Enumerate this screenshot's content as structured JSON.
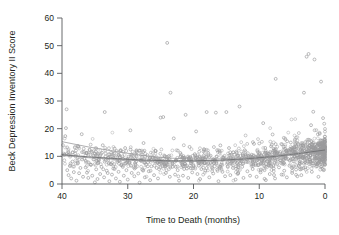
{
  "chart_data": {
    "type": "scatter",
    "title": "",
    "xlabel": "Time to Death (months)",
    "ylabel": "Beck Depression Inventory II Score",
    "xlim": [
      40,
      0
    ],
    "ylim": [
      0,
      60
    ],
    "x_reversed": true,
    "grid": false,
    "legend": false,
    "xticks": [
      40,
      30,
      20,
      10,
      0
    ],
    "yticks": [
      0,
      10,
      20,
      30,
      40,
      50,
      60
    ],
    "xtick_labels": [
      "40",
      "30",
      "20",
      "10",
      "0"
    ],
    "ytick_labels": [
      "0",
      "10",
      "20",
      "30",
      "40",
      "50",
      "60"
    ],
    "marker": "open-circle",
    "marker_color": "#9a9a9c",
    "fit_line_color": "#6d6e71",
    "band_line_color": "#9b9b9d",
    "fit_curve": {
      "description": "regression fit with upper and lower confidence bands",
      "x": [
        40,
        36,
        32,
        28,
        24,
        20,
        16,
        12,
        8,
        4,
        0
      ],
      "center": [
        10.6,
        9.8,
        9.2,
        8.7,
        8.4,
        8.4,
        8.6,
        9.1,
        9.9,
        11.0,
        12.3
      ],
      "upper": [
        15.3,
        13.4,
        11.8,
        10.4,
        9.4,
        9.0,
        9.1,
        9.5,
        10.3,
        11.4,
        12.8
      ],
      "lower": [
        10.3,
        9.5,
        8.9,
        8.4,
        8.1,
        8.1,
        8.3,
        8.8,
        9.6,
        10.7,
        11.9
      ]
    },
    "notable_outliers": [
      {
        "x": 24,
        "y": 51
      },
      {
        "x": 2.5,
        "y": 47
      },
      {
        "x": 2.8,
        "y": 46
      },
      {
        "x": 1.6,
        "y": 45
      },
      {
        "x": 7.5,
        "y": 38
      },
      {
        "x": 0.6,
        "y": 37
      },
      {
        "x": 23.5,
        "y": 33
      },
      {
        "x": 3.2,
        "y": 33
      },
      {
        "x": 39.5,
        "y": 27
      },
      {
        "x": 33.5,
        "y": 26
      }
    ],
    "points": [
      [
        39.6,
        10.6
      ],
      [
        39.4,
        20.2
      ],
      [
        39.5,
        17.3
      ],
      [
        39.3,
        27.0
      ],
      [
        39.2,
        5.0
      ],
      [
        39.0,
        3.2
      ],
      [
        38.8,
        6.5
      ],
      [
        38.6,
        2.0
      ],
      [
        38.4,
        8.1
      ],
      [
        38.2,
        4.3
      ],
      [
        38.0,
        11.0
      ],
      [
        37.8,
        1.2
      ],
      [
        37.6,
        7.4
      ],
      [
        37.4,
        3.9
      ],
      [
        37.2,
        5.8
      ],
      [
        37.0,
        18.0
      ],
      [
        36.8,
        2.6
      ],
      [
        36.6,
        9.1
      ],
      [
        36.4,
        6.0
      ],
      [
        36.2,
        4.1
      ],
      [
        36.0,
        2.2
      ],
      [
        35.8,
        12.4
      ],
      [
        35.6,
        7.0
      ],
      [
        35.4,
        3.0
      ],
      [
        35.2,
        10.2
      ],
      [
        35.0,
        0.6
      ],
      [
        35.0,
        11.0
      ],
      [
        34.8,
        5.3
      ],
      [
        34.6,
        1.8
      ],
      [
        34.4,
        8.6
      ],
      [
        34.2,
        3.6
      ],
      [
        34.0,
        6.2
      ],
      [
        33.8,
        14.0
      ],
      [
        33.6,
        2.4
      ],
      [
        33.5,
        26.0
      ],
      [
        33.2,
        4.8
      ],
      [
        33.0,
        9.5
      ],
      [
        32.8,
        1.0
      ],
      [
        32.6,
        7.2
      ],
      [
        32.4,
        3.4
      ],
      [
        32.2,
        5.6
      ],
      [
        32.0,
        12.8
      ],
      [
        31.8,
        2.0
      ],
      [
        31.6,
        8.0
      ],
      [
        31.4,
        4.4
      ],
      [
        31.2,
        0.8
      ],
      [
        31.0,
        6.8
      ],
      [
        30.8,
        10.0
      ],
      [
        30.6,
        3.0
      ],
      [
        30.4,
        13.0
      ],
      [
        30.2,
        5.0
      ],
      [
        30.0,
        1.6
      ],
      [
        29.8,
        7.6
      ],
      [
        29.6,
        19.4
      ],
      [
        29.4,
        4.0
      ],
      [
        29.2,
        9.0
      ],
      [
        29.0,
        2.8
      ],
      [
        28.8,
        6.0
      ],
      [
        28.6,
        11.5
      ],
      [
        28.4,
        3.8
      ],
      [
        28.2,
        0.5
      ],
      [
        28.0,
        8.4
      ],
      [
        27.8,
        5.2
      ],
      [
        27.6,
        14.8
      ],
      [
        27.4,
        2.4
      ],
      [
        27.2,
        7.0
      ],
      [
        27.0,
        10.4
      ],
      [
        26.8,
        4.6
      ],
      [
        26.6,
        1.4
      ],
      [
        26.4,
        6.4
      ],
      [
        26.2,
        9.8
      ],
      [
        26.0,
        3.2
      ],
      [
        25.8,
        12.0
      ],
      [
        25.6,
        5.8
      ],
      [
        25.4,
        2.0
      ],
      [
        25.2,
        8.2
      ],
      [
        25.0,
        24.0
      ],
      [
        24.6,
        24.2
      ],
      [
        24.4,
        7.0
      ],
      [
        24.2,
        4.0
      ],
      [
        24.0,
        51.0
      ],
      [
        23.8,
        10.0
      ],
      [
        23.6,
        2.6
      ],
      [
        23.5,
        33.0
      ],
      [
        23.2,
        6.2
      ],
      [
        23.0,
        16.5
      ],
      [
        22.8,
        3.4
      ],
      [
        22.6,
        8.8
      ],
      [
        22.4,
        5.0
      ],
      [
        22.2,
        1.2
      ],
      [
        22.0,
        11.2
      ],
      [
        21.8,
        7.4
      ],
      [
        21.6,
        3.0
      ],
      [
        21.4,
        9.4
      ],
      [
        21.2,
        25.0
      ],
      [
        21.0,
        5.6
      ],
      [
        20.8,
        2.2
      ],
      [
        20.6,
        13.4
      ],
      [
        20.4,
        8.0
      ],
      [
        20.2,
        4.2
      ],
      [
        20.0,
        6.6
      ],
      [
        19.8,
        10.8
      ],
      [
        19.6,
        19.0
      ],
      [
        19.4,
        3.6
      ],
      [
        19.2,
        7.8
      ],
      [
        19.0,
        1.8
      ],
      [
        18.8,
        5.4
      ],
      [
        18.6,
        9.2
      ],
      [
        18.4,
        12.6
      ],
      [
        18.2,
        4.8
      ],
      [
        18.0,
        26.0
      ],
      [
        17.8,
        7.2
      ],
      [
        17.6,
        2.4
      ],
      [
        17.4,
        10.2
      ],
      [
        17.2,
        6.0
      ],
      [
        17.0,
        3.8
      ],
      [
        16.8,
        8.6
      ],
      [
        16.6,
        25.8
      ],
      [
        16.4,
        5.2
      ],
      [
        16.2,
        1.0
      ],
      [
        16.0,
        11.8
      ],
      [
        15.8,
        7.0
      ],
      [
        15.6,
        4.4
      ],
      [
        15.4,
        9.6
      ],
      [
        15.2,
        2.8
      ],
      [
        15.0,
        26.0
      ],
      [
        14.8,
        6.4
      ],
      [
        14.6,
        13.0
      ],
      [
        14.4,
        3.2
      ],
      [
        14.2,
        8.2
      ],
      [
        14.0,
        5.8
      ],
      [
        13.8,
        10.6
      ],
      [
        13.6,
        1.6
      ],
      [
        13.4,
        7.6
      ],
      [
        13.2,
        4.0
      ],
      [
        13.0,
        28.0
      ],
      [
        12.8,
        9.0
      ],
      [
        12.6,
        6.2
      ],
      [
        12.4,
        2.2
      ],
      [
        12.2,
        12.2
      ],
      [
        12.0,
        8.0
      ],
      [
        11.8,
        4.6
      ],
      [
        11.6,
        10.0
      ],
      [
        11.4,
        3.0
      ],
      [
        11.2,
        7.2
      ],
      [
        11.0,
        5.4
      ],
      [
        10.8,
        14.5
      ],
      [
        10.6,
        9.8
      ],
      [
        10.4,
        2.6
      ],
      [
        10.2,
        6.8
      ],
      [
        10.0,
        11.4
      ],
      [
        9.8,
        4.2
      ],
      [
        9.6,
        8.4
      ],
      [
        9.4,
        22.0
      ],
      [
        9.2,
        5.0
      ],
      [
        9.0,
        1.4
      ],
      [
        8.8,
        10.4
      ],
      [
        8.6,
        7.0
      ],
      [
        8.4,
        3.6
      ],
      [
        8.2,
        13.6
      ],
      [
        8.0,
        9.2
      ],
      [
        7.8,
        5.6
      ],
      [
        7.6,
        2.0
      ],
      [
        7.5,
        38.0
      ],
      [
        7.2,
        8.8
      ],
      [
        7.0,
        6.0
      ],
      [
        6.8,
        11.6
      ],
      [
        6.6,
        3.4
      ],
      [
        6.4,
        7.8
      ],
      [
        6.2,
        4.8
      ],
      [
        6.0,
        10.2
      ],
      [
        5.8,
        2.4
      ],
      [
        5.6,
        9.0
      ],
      [
        5.4,
        6.6
      ],
      [
        5.2,
        15.0
      ],
      [
        5.0,
        4.0
      ],
      [
        4.8,
        8.2
      ],
      [
        4.6,
        12.4
      ],
      [
        4.4,
        5.2
      ],
      [
        4.2,
        2.8
      ],
      [
        4.0,
        10.8
      ],
      [
        3.8,
        7.4
      ],
      [
        3.6,
        3.2
      ],
      [
        3.4,
        9.4
      ],
      [
        3.2,
        33.0
      ],
      [
        3.0,
        6.0
      ],
      [
        2.8,
        46.0
      ],
      [
        2.6,
        11.0
      ],
      [
        2.5,
        47.0
      ],
      [
        2.2,
        8.0
      ],
      [
        2.0,
        4.4
      ],
      [
        1.8,
        13.2
      ],
      [
        1.6,
        45.0
      ],
      [
        1.4,
        9.6
      ],
      [
        1.2,
        6.4
      ],
      [
        1.0,
        2.6
      ],
      [
        0.8,
        12.0
      ],
      [
        0.6,
        37.0
      ],
      [
        0.4,
        8.6
      ],
      [
        0.2,
        5.0
      ],
      [
        0.1,
        10.4
      ]
    ]
  },
  "figure": {
    "background": "#ffffff",
    "axis_color": "#58595b",
    "text_color": "#231f20"
  }
}
